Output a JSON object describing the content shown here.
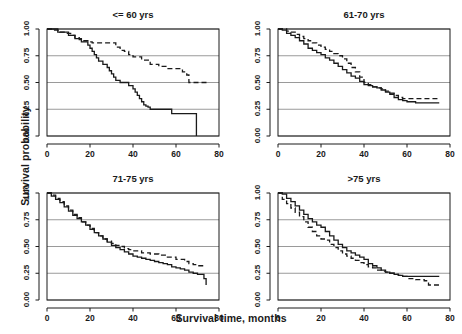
{
  "figure": {
    "kind": "kaplan-meier-survival-panels",
    "xlabel": "Survival time, months",
    "ylabel": "Survival probability",
    "grid_color": "#9a9a9a",
    "frame_color": "#1a1a1a",
    "solid_color": "#1a1a1a",
    "dashed_color": "#1a1a1a"
  },
  "axes": {
    "x_ticks": [
      "0",
      "20",
      "40",
      "60",
      "80"
    ],
    "x_tick_values": [
      0,
      20,
      40,
      60,
      80
    ],
    "y_ticks": [
      "0.00",
      "0.25",
      "0.50",
      "0.75",
      "1.00"
    ],
    "y_tick_values": [
      0,
      0.25,
      0.5,
      0.75,
      1.0
    ],
    "xlim": [
      0,
      80
    ],
    "ylim": [
      0,
      1
    ]
  },
  "chart_data": {
    "type": "line",
    "xlabel": "Survival time, months",
    "ylabel": "Survival probability",
    "xlim": [
      0,
      80
    ],
    "ylim": [
      0,
      1
    ],
    "grid": true,
    "legend_position": "none",
    "panels": [
      {
        "title": "<= 60 yrs",
        "series": [
          {
            "name": "solid",
            "style": "solid",
            "x": [
              0,
              2,
              5,
              8,
              10,
              11,
              13,
              14,
              16,
              17,
              18,
              19,
              20,
              21,
              22,
              23,
              24,
              26,
              28,
              29,
              30,
              31,
              32,
              34,
              36,
              38,
              40,
              41,
              42,
              43,
              44,
              45,
              46,
              47,
              48,
              50,
              52,
              56,
              58,
              62,
              66,
              69,
              69.5
            ],
            "y": [
              1.0,
              1.0,
              0.97,
              0.97,
              0.94,
              0.94,
              0.91,
              0.91,
              0.88,
              0.88,
              0.88,
              0.85,
              0.82,
              0.79,
              0.76,
              0.73,
              0.7,
              0.67,
              0.64,
              0.61,
              0.58,
              0.55,
              0.52,
              0.5,
              0.5,
              0.47,
              0.44,
              0.41,
              0.38,
              0.35,
              0.32,
              0.29,
              0.28,
              0.27,
              0.25,
              0.25,
              0.25,
              0.25,
              0.21,
              0.21,
              0.21,
              0.21,
              0.0
            ]
          },
          {
            "name": "dashed",
            "style": "dashed",
            "x": [
              0,
              3,
              6,
              9,
              11,
              13,
              15,
              17,
              19,
              21,
              24,
              27,
              30,
              32,
              34,
              36,
              38,
              40,
              44,
              48,
              52,
              56,
              60,
              63,
              65,
              66,
              70,
              75
            ],
            "y": [
              1.0,
              0.99,
              0.97,
              0.96,
              0.94,
              0.92,
              0.9,
              0.89,
              0.88,
              0.87,
              0.87,
              0.87,
              0.87,
              0.83,
              0.8,
              0.79,
              0.76,
              0.74,
              0.71,
              0.67,
              0.65,
              0.63,
              0.63,
              0.6,
              0.57,
              0.5,
              0.5,
              0.5
            ]
          }
        ]
      },
      {
        "title": "61-70 yrs",
        "series": [
          {
            "name": "solid",
            "style": "solid",
            "x": [
              0,
              2,
              4,
              6,
              8,
              10,
              12,
              14,
              16,
              18,
              20,
              22,
              24,
              26,
              28,
              30,
              32,
              34,
              36,
              38,
              40,
              42,
              44,
              46,
              48,
              50,
              52,
              54,
              56,
              58,
              60,
              62,
              64,
              66,
              70,
              75
            ],
            "y": [
              1.0,
              0.99,
              0.96,
              0.94,
              0.92,
              0.89,
              0.86,
              0.82,
              0.8,
              0.78,
              0.76,
              0.73,
              0.71,
              0.68,
              0.65,
              0.62,
              0.59,
              0.56,
              0.54,
              0.51,
              0.48,
              0.47,
              0.46,
              0.45,
              0.43,
              0.41,
              0.39,
              0.36,
              0.34,
              0.33,
              0.32,
              0.32,
              0.31,
              0.31,
              0.31,
              0.31
            ]
          },
          {
            "name": "dashed",
            "style": "dashed",
            "x": [
              0,
              2,
              4,
              6,
              8,
              10,
              12,
              14,
              16,
              18,
              20,
              22,
              24,
              26,
              28,
              30,
              32,
              34,
              36,
              38,
              40,
              42,
              44,
              46,
              48,
              50,
              52,
              54,
              56,
              58,
              60,
              64,
              68,
              72,
              75
            ],
            "y": [
              1.0,
              1.0,
              0.98,
              0.97,
              0.95,
              0.93,
              0.91,
              0.89,
              0.87,
              0.85,
              0.83,
              0.81,
              0.79,
              0.77,
              0.75,
              0.72,
              0.68,
              0.64,
              0.6,
              0.55,
              0.5,
              0.48,
              0.46,
              0.45,
              0.44,
              0.42,
              0.4,
              0.38,
              0.36,
              0.35,
              0.35,
              0.35,
              0.35,
              0.35,
              0.35
            ]
          }
        ]
      },
      {
        "title": "71-75 yrs",
        "series": [
          {
            "name": "solid",
            "style": "solid",
            "x": [
              0,
              2,
              4,
              6,
              8,
              10,
              12,
              14,
              16,
              18,
              20,
              22,
              24,
              26,
              28,
              30,
              32,
              34,
              36,
              38,
              40,
              42,
              44,
              46,
              48,
              50,
              52,
              54,
              56,
              58,
              60,
              62,
              64,
              66,
              68,
              70,
              72,
              73,
              74
            ],
            "y": [
              1.0,
              0.97,
              0.94,
              0.91,
              0.87,
              0.83,
              0.79,
              0.76,
              0.73,
              0.7,
              0.66,
              0.63,
              0.6,
              0.57,
              0.54,
              0.51,
              0.49,
              0.47,
              0.45,
              0.43,
              0.41,
              0.4,
              0.39,
              0.38,
              0.37,
              0.36,
              0.35,
              0.34,
              0.33,
              0.31,
              0.3,
              0.29,
              0.28,
              0.26,
              0.25,
              0.24,
              0.24,
              0.2,
              0.14
            ]
          },
          {
            "name": "dashed",
            "style": "dashed",
            "x": [
              0,
              2,
              4,
              6,
              8,
              10,
              12,
              14,
              16,
              18,
              20,
              22,
              24,
              26,
              28,
              30,
              32,
              34,
              36,
              38,
              40,
              44,
              48,
              52,
              56,
              60,
              64,
              66,
              68,
              70,
              74
            ],
            "y": [
              1.0,
              0.98,
              0.95,
              0.92,
              0.88,
              0.84,
              0.8,
              0.77,
              0.73,
              0.7,
              0.67,
              0.63,
              0.6,
              0.57,
              0.55,
              0.53,
              0.51,
              0.5,
              0.48,
              0.47,
              0.46,
              0.44,
              0.43,
              0.42,
              0.4,
              0.38,
              0.36,
              0.34,
              0.33,
              0.32,
              0.32
            ]
          }
        ]
      },
      {
        "title": ">75 yrs",
        "series": [
          {
            "name": "solid",
            "style": "solid",
            "x": [
              0,
              2,
              4,
              6,
              8,
              10,
              12,
              14,
              16,
              18,
              20,
              22,
              24,
              26,
              28,
              30,
              32,
              34,
              36,
              38,
              40,
              42,
              44,
              46,
              48,
              50,
              52,
              54,
              56,
              58,
              60,
              64,
              68,
              72,
              75
            ],
            "y": [
              1.0,
              0.99,
              0.95,
              0.92,
              0.88,
              0.84,
              0.8,
              0.76,
              0.73,
              0.7,
              0.68,
              0.64,
              0.6,
              0.56,
              0.52,
              0.49,
              0.46,
              0.44,
              0.42,
              0.4,
              0.38,
              0.34,
              0.32,
              0.3,
              0.28,
              0.26,
              0.25,
              0.24,
              0.23,
              0.22,
              0.22,
              0.22,
              0.22,
              0.22,
              0.22
            ]
          },
          {
            "name": "dashed",
            "style": "dashed",
            "x": [
              0,
              2,
              4,
              6,
              8,
              10,
              12,
              14,
              16,
              18,
              20,
              22,
              24,
              26,
              28,
              30,
              32,
              34,
              36,
              38,
              40,
              42,
              44,
              46,
              48,
              50,
              52,
              54,
              56,
              58,
              60,
              62,
              64,
              66,
              68,
              70,
              72,
              75
            ],
            "y": [
              1.0,
              0.94,
              0.9,
              0.86,
              0.82,
              0.78,
              0.73,
              0.68,
              0.64,
              0.6,
              0.57,
              0.56,
              0.52,
              0.49,
              0.46,
              0.43,
              0.41,
              0.39,
              0.37,
              0.35,
              0.33,
              0.31,
              0.3,
              0.28,
              0.27,
              0.26,
              0.25,
              0.24,
              0.23,
              0.22,
              0.2,
              0.2,
              0.19,
              0.19,
              0.18,
              0.14,
              0.14,
              0.14
            ]
          }
        ]
      }
    ]
  }
}
